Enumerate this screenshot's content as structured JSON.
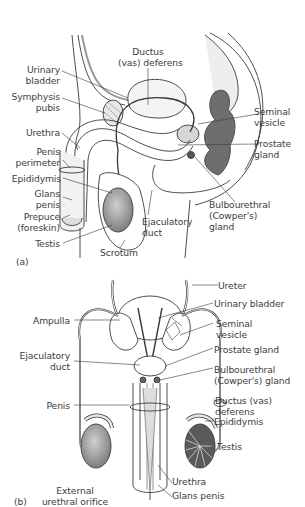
{
  "figure_a": {
    "panel_label": "(a)",
    "labels": {
      "ductus_deferens": [
        "Ductus",
        "(vas) deferens"
      ],
      "urinary_bladder": [
        "Urinary",
        "bladder"
      ],
      "symphysis_pubis": [
        "Symphysis",
        "pubis"
      ],
      "urethra": [
        "Urethra"
      ],
      "penis_perimeter": [
        "Penis",
        "perimeter"
      ],
      "epididymis": [
        "Epididymis"
      ],
      "glans_penis": [
        "Glans",
        "penis"
      ],
      "prepuce": [
        "Prepuce",
        "(foreskin)"
      ],
      "testis": [
        "Testis"
      ],
      "scrotum": [
        "Scrotum"
      ],
      "ejaculatory_duct": [
        "Ejaculatory",
        "duct"
      ],
      "seminal_vesicle": [
        "Seminal",
        "vesicle"
      ],
      "prostate_gland": [
        "Prostate",
        "gland"
      ],
      "bulbourethral_gland": [
        "Bulbourethral",
        "(Cowper's)",
        "gland"
      ]
    }
  },
  "figure_b": {
    "labels": {
      "ureter": [
        "Ureter"
      ],
      "urinary_bladder": [
        "Urinary bladder"
      ],
      "seminal_vesicle": [
        "Seminal",
        "vesicle"
      ],
      "prostate_gland": [
        "Prostate gland"
      ],
      "bulbourethral_gland": [
        "Bulbourethral",
        "(Cowper's) gland"
      ],
      "ductus_deferens": [
        "Ductus (vas)",
        "deferens"
      ],
      "epididymis": [
        "Epididymis"
      ],
      "testis": [
        "Testis"
      ],
      "urethra": [
        "Urethra"
      ],
      "glans_penis": [
        "Glans penis"
      ],
      "ampulla": [
        "Ampulla"
      ],
      "ejaculatory_duct": [
        "Ejaculatory",
        "duct"
      ],
      "penis": [
        "Penis"
      ],
      "external_urethral_orifice": [
        "External",
        "urethral orifice"
      ],
      "panel_label": "(b)"
    }
  },
  "colors": {
    "line": "#3a3a3a",
    "organ_fill": "#d9d9d9",
    "dark_fill": "#6e6e6e",
    "testis_fill": "#a8a8a8"
  }
}
